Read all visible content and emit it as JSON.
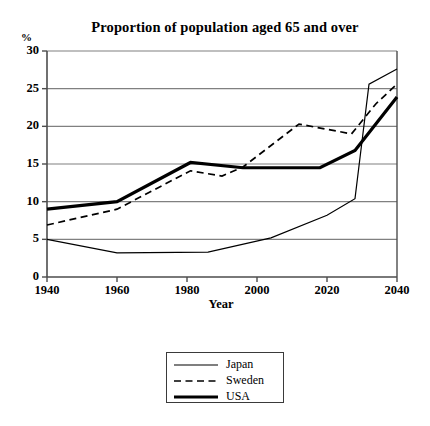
{
  "chart_data": {
    "type": "line",
    "title": "Proportion of population aged 65 and over",
    "xlabel": "Year",
    "ylabel": "%",
    "y_unit": "%",
    "xlim": [
      1940,
      2040
    ],
    "ylim": [
      0,
      30
    ],
    "xticks": [
      "1940",
      "1960",
      "1980",
      "2000",
      "2020",
      "2040"
    ],
    "yticks": [
      "0",
      "5",
      "10",
      "15",
      "20",
      "25",
      "30"
    ],
    "grid": "horizontal",
    "legend_position": "below-plot",
    "series": [
      {
        "name": "Japan",
        "style": "thin-solid",
        "color": "#000000",
        "x": [
          1940,
          1960,
          1986,
          2004,
          2020,
          2028,
          2032,
          2040
        ],
        "values": [
          5.0,
          3.2,
          3.3,
          5.2,
          8.2,
          10.4,
          25.6,
          27.6
        ]
      },
      {
        "name": "Sweden",
        "style": "dashed",
        "color": "#000000",
        "x": [
          1940,
          1960,
          1981,
          1990,
          1996,
          2012,
          2027,
          2034,
          2040
        ],
        "values": [
          6.9,
          9.0,
          14.1,
          13.4,
          14.6,
          20.3,
          19.0,
          23.0,
          25.6
        ]
      },
      {
        "name": "USA",
        "style": "thick-solid",
        "color": "#000000",
        "x": [
          1940,
          1960,
          1981,
          1996,
          2018,
          2028,
          2040
        ],
        "values": [
          9.0,
          10.0,
          15.2,
          14.5,
          14.5,
          16.8,
          23.9
        ]
      }
    ]
  },
  "legend": {
    "items": [
      {
        "label": "Japan"
      },
      {
        "label": "Sweden"
      },
      {
        "label": "USA"
      }
    ]
  }
}
